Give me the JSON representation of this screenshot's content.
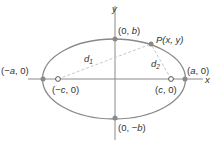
{
  "diagram": {
    "type": "ellipse-foci",
    "axes": {
      "x_label": "x",
      "y_label": "y"
    },
    "points": {
      "vertex_left": {
        "label_prefix": "(−",
        "var": "a",
        "label_suffix": ", 0)"
      },
      "vertex_right": {
        "label_prefix": "(",
        "var": "a",
        "label_suffix": ", 0)"
      },
      "covertex_top": {
        "label_prefix": "(0, ",
        "var": "b",
        "label_suffix": ")"
      },
      "covertex_bottom": {
        "label_prefix": "(0, −",
        "var": "b",
        "label_suffix": ")"
      },
      "focus_left": {
        "label_prefix": "(−",
        "var": "c",
        "label_suffix": ", 0)"
      },
      "focus_right": {
        "label_prefix": "(",
        "var": "c",
        "label_suffix": ", 0)"
      },
      "point_p": {
        "name": "P",
        "label_rest": "(x, y)"
      }
    },
    "distances": {
      "d1": {
        "base": "d",
        "sub": "1"
      },
      "d2": {
        "base": "d",
        "sub": "2"
      }
    },
    "colors": {
      "ellipse": "#8a8a8a",
      "axis": "#8a8a8a",
      "point": "#8a8a8a",
      "dashed": "#c8c8c8",
      "text": "#333333"
    }
  }
}
